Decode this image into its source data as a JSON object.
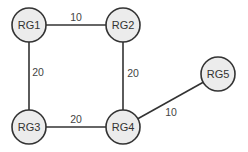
{
  "diagram": {
    "type": "network-graph",
    "nodes": [
      {
        "id": "RG1",
        "label": "RG1",
        "x": 29,
        "y": 25
      },
      {
        "id": "RG2",
        "label": "RG2",
        "x": 123,
        "y": 25
      },
      {
        "id": "RG3",
        "label": "RG3",
        "x": 29,
        "y": 127
      },
      {
        "id": "RG4",
        "label": "RG4",
        "x": 123,
        "y": 127
      },
      {
        "id": "RG5",
        "label": "RG5",
        "x": 218,
        "y": 74
      }
    ],
    "edges": [
      {
        "from": "RG1",
        "to": "RG2",
        "weight": "10",
        "label_x": 76,
        "label_y": 17
      },
      {
        "from": "RG1",
        "to": "RG3",
        "weight": "20",
        "label_x": 38,
        "label_y": 72
      },
      {
        "from": "RG2",
        "to": "RG4",
        "weight": "20",
        "label_x": 133,
        "label_y": 73
      },
      {
        "from": "RG3",
        "to": "RG4",
        "weight": "20",
        "label_x": 76,
        "label_y": 119
      },
      {
        "from": "RG4",
        "to": "RG5",
        "weight": "10",
        "label_x": 171,
        "label_y": 112
      }
    ],
    "node_radius": 17,
    "colors": {
      "node_fill": "#ececec",
      "stroke": "#333333",
      "text": "#333333"
    }
  }
}
